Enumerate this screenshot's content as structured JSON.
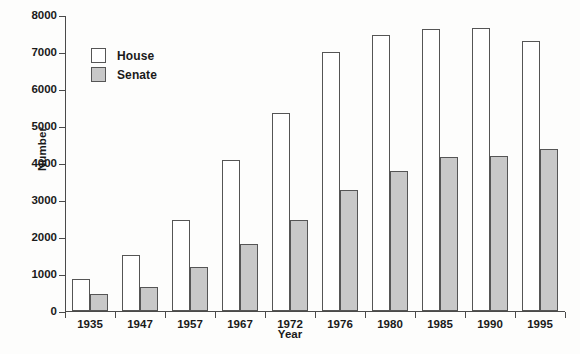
{
  "chart_data": {
    "type": "bar",
    "title": "",
    "xlabel": "Year",
    "ylabel": "Number",
    "categories": [
      "1935",
      "1947",
      "1957",
      "1967",
      "1972",
      "1976",
      "1980",
      "1985",
      "1990",
      "1995"
    ],
    "series": [
      {
        "name": "House",
        "color": "#ffffff",
        "values": [
          865,
          1510,
          2460,
          4080,
          5340,
          7000,
          7440,
          7600,
          7650,
          7280
        ]
      },
      {
        "name": "Senate",
        "color": "#c8c8c8",
        "values": [
          460,
          650,
          1170,
          1790,
          2440,
          3250,
          3780,
          4160,
          4180,
          4360
        ]
      }
    ],
    "ylim": [
      0,
      8000
    ],
    "ytick_values": [
      0,
      1000,
      2000,
      3000,
      4000,
      5000,
      6000,
      7000,
      8000
    ],
    "ytick_labels": [
      "0",
      "1000",
      "2000",
      "3000",
      "4000",
      "5000",
      "6000",
      "7000",
      "8000"
    ],
    "grid": false,
    "legend_position": "upper-left-inside",
    "legend": [
      "House",
      "Senate"
    ],
    "axis_color": "#4a4a4a",
    "bar_edge_color": "#555555",
    "background": "#fdfdfc"
  }
}
